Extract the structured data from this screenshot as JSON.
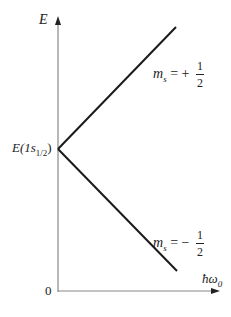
{
  "diagram": {
    "type": "energy-level-splitting",
    "y_axis": {
      "label": "E"
    },
    "x_axis": {
      "label": "ħω₀",
      "label_base": "ħω",
      "label_sub": "0",
      "origin_label": "0"
    },
    "vertex_label": {
      "prefix": "E(1",
      "s": "s",
      "sub": "1/2",
      "suffix": ")"
    },
    "lines": [
      {
        "name": "ms-plus-half",
        "label_m": "m",
        "label_sub": "s",
        "label_eq": " = +",
        "frac_num": "1",
        "frac_den": "2",
        "from": [
          58,
          149
        ],
        "to": [
          176,
          27
        ]
      },
      {
        "name": "ms-minus-half",
        "label_m": "m",
        "label_sub": "s",
        "label_eq": " = −",
        "frac_num": "1",
        "frac_den": "2",
        "from": [
          58,
          149
        ],
        "to": [
          177,
          271
        ]
      }
    ],
    "colors": {
      "axis": "#888888",
      "line": "#1a1a1a",
      "text": "#222222"
    }
  }
}
